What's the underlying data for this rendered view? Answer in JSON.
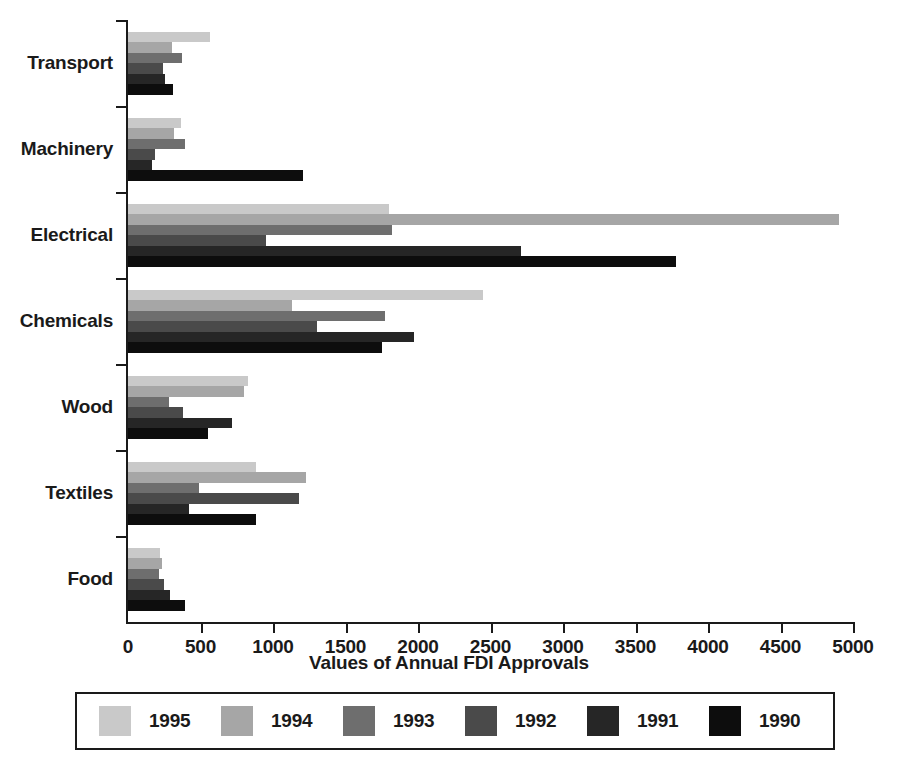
{
  "chart_data": {
    "type": "bar",
    "orientation": "horizontal",
    "title": "",
    "xlabel": "Values of Annual FDI Approvals",
    "ylabel": "",
    "xlim": [
      0,
      5000
    ],
    "xticks": [
      0,
      500,
      1000,
      1500,
      2000,
      2500,
      3000,
      3500,
      4000,
      4500,
      5000
    ],
    "grid": false,
    "legend_position": "bottom",
    "categories": [
      "Transport",
      "Machinery",
      "Electrical",
      "Chemicals",
      "Wood",
      "Textiles",
      "Food"
    ],
    "series": [
      {
        "name": "1995",
        "color": "#c9c9c9",
        "values": [
          565,
          365,
          1800,
          2450,
          830,
          880,
          220
        ]
      },
      {
        "name": "1994",
        "color": "#a6a6a6",
        "values": [
          305,
          315,
          4900,
          1130,
          800,
          1230,
          235
        ]
      },
      {
        "name": "1993",
        "color": "#6e6e6e",
        "values": [
          370,
          390,
          1820,
          1770,
          280,
          490,
          215
        ]
      },
      {
        "name": "1992",
        "color": "#4a4a4a",
        "values": [
          240,
          185,
          950,
          1300,
          380,
          1180,
          250
        ]
      },
      {
        "name": "1991",
        "color": "#262626",
        "values": [
          255,
          165,
          2710,
          1970,
          720,
          420,
          290
        ]
      },
      {
        "name": "1990",
        "color": "#0d0d0d",
        "values": [
          310,
          1210,
          3780,
          1750,
          550,
          880,
          390
        ]
      }
    ]
  }
}
